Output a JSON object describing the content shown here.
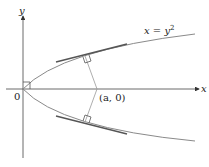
{
  "diagram": {
    "axes": {
      "x_label": "x",
      "y_label": "y",
      "origin_label": "0"
    },
    "curve": {
      "equation_lhs": "x = y",
      "equation_exp": "2",
      "color": "#8a8a8a"
    },
    "point": {
      "label": "(a, 0)"
    },
    "elements": [
      "parabola x = y^2",
      "tangent line at upper point",
      "tangent line at lower point",
      "normal line from (a,0) to upper point",
      "normal line from (a,0) to lower point",
      "right-angle markers at tangency points and origin"
    ],
    "colors": {
      "axis": "#333333",
      "curve": "#8a8a8a",
      "tangent": "#555555",
      "normal": "#9a9a9a"
    }
  }
}
